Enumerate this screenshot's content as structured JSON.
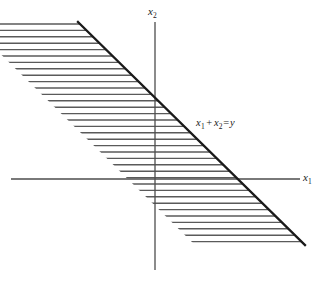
{
  "figure": {
    "type": "math-diagram",
    "background_color": "#ffffff",
    "line_color": "#1a1a1a",
    "hatch_color": "#5a5a5a",
    "axis_color": "#4d4d4d"
  },
  "axes": {
    "x_axis": {
      "name": "x1-axis",
      "label_main": "x",
      "label_sub": "1",
      "y": 179,
      "x_start": 11,
      "x_end": 300
    },
    "y_axis": {
      "name": "x2-axis",
      "label_main": "x",
      "label_sub": "2",
      "x": 155,
      "y_start": 22,
      "y_end": 270
    }
  },
  "chart_data": {
    "type": "line",
    "title": "",
    "xlabel": "x1",
    "ylabel": "x2",
    "grid": false,
    "legend": "none",
    "annotations": [
      {
        "name": "constraint-line-label",
        "text_parts": {
          "term1": "x",
          "term1_sub": "1",
          "operator": "+",
          "term2": "x",
          "term2_sub": "2",
          "equals": "=",
          "rhs": "y"
        },
        "full_text": "x1 + x2 = y",
        "x": 196,
        "y": 118
      }
    ],
    "series": [
      {
        "name": "boundary-line",
        "equation": "x1 + x2 = y",
        "slope": -1,
        "points": [
          {
            "x": 78,
            "y": 22
          },
          {
            "x": 305,
            "y": 245
          }
        ],
        "y_intercept_px": {
          "x": 155,
          "y": 96
        },
        "x_intercept_px": {
          "x": 233,
          "y": 179
        },
        "stroke_width": 2.3
      },
      {
        "name": "region-left-boundary",
        "description": "parallel offset edge of hatched band",
        "slope": -1,
        "points": [
          {
            "x": -32,
            "y": 22
          },
          {
            "x": 195,
            "y": 245
          }
        ]
      }
    ],
    "shaded_region": {
      "name": "feasible-band",
      "style": "horizontal-hatch",
      "hatch_spacing_px": 6.4,
      "hatch_stroke_width": 1.4,
      "top_y": 22,
      "bottom_y": 245,
      "offset_px": 110
    }
  }
}
